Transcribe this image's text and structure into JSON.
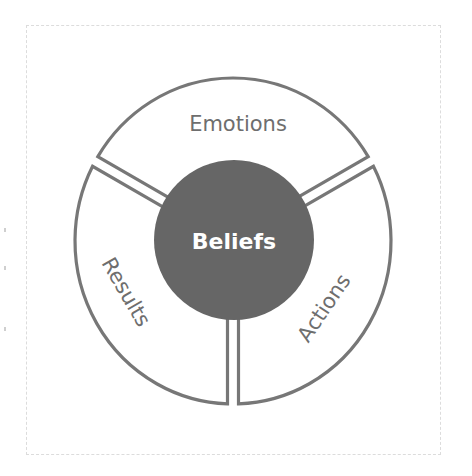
{
  "diagram": {
    "title": "",
    "center": {
      "label": "Beliefs",
      "fill": "#666666",
      "text_color": "#ffffff"
    },
    "segments": [
      {
        "id": "emotions",
        "label": "Emotions",
        "start_deg": 210,
        "end_deg": 330,
        "label_x": 238,
        "label_y": 124,
        "label_rotate": 0
      },
      {
        "id": "actions",
        "label": "Actions",
        "start_deg": 330,
        "end_deg": 450,
        "label_x": 324,
        "label_y": 308,
        "label_rotate": -56
      },
      {
        "id": "results",
        "label": "Results",
        "start_deg": 90,
        "end_deg": 210,
        "label_x": 126,
        "label_y": 292,
        "label_rotate": 60
      }
    ],
    "colors": {
      "stroke": "#777777",
      "segment_fill": "#ffffff",
      "segment_text": "#6e6e6e",
      "frame": "#dcdcdc"
    }
  }
}
